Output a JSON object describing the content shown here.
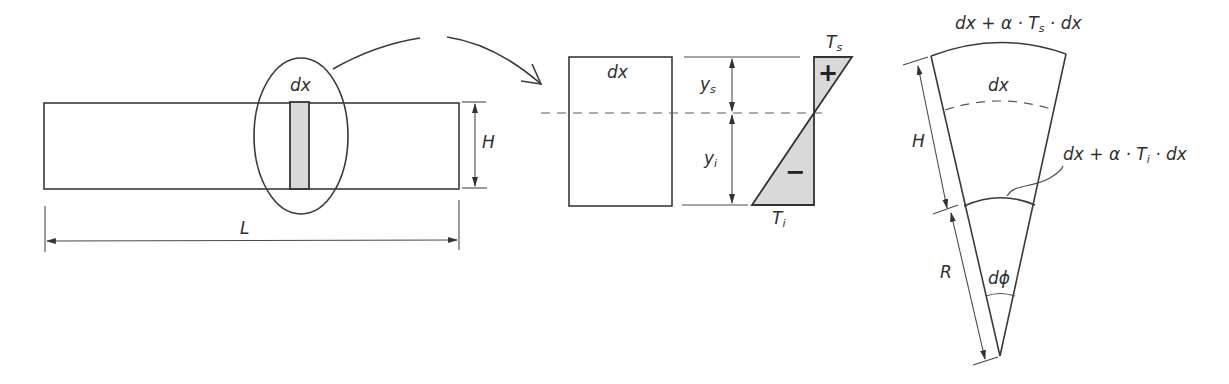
{
  "figure": {
    "beam": {
      "element_label": "dx",
      "height_label": "H",
      "length_label": "L"
    },
    "section": {
      "element_label": "dx",
      "upper_distance_label": "y",
      "upper_distance_sub": "s",
      "lower_distance_label": "y",
      "lower_distance_sub": "i",
      "top_temperature_label": "T",
      "top_temperature_sub": "s",
      "bottom_temperature_label": "T",
      "bottom_temperature_sub": "i",
      "positive_sign": "+",
      "negative_sign": "−"
    },
    "deformed": {
      "top_arc_label_pre": "dx + α · T",
      "top_arc_label_sub": "s",
      "top_arc_label_post": " · dx",
      "mid_arc_label": "dx",
      "bottom_arc_label_pre": "dx + α · T",
      "bottom_arc_label_sub": "i",
      "bottom_arc_label_post": " · dx",
      "height_label": "H",
      "radius_label": "R",
      "angle_label": "dϕ"
    },
    "colors": {
      "line": "#3a3a3a",
      "shade": "#d9d9d9",
      "background": "#ffffff"
    }
  }
}
